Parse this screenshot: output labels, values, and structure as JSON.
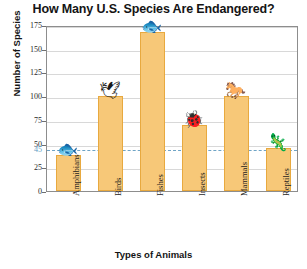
{
  "chart_data": {
    "type": "bar",
    "title": "How Many U.S. Species Are Endangered?",
    "xlabel": "Types of Animals",
    "ylabel": "Number of Species",
    "categories": [
      "Amphibians",
      "Birds",
      "Fishes",
      "Insects",
      "Mammals",
      "Reptiles"
    ],
    "values": [
      38,
      100,
      168,
      70,
      100,
      45
    ],
    "ylim": [
      0,
      175
    ],
    "ytick_labels": [
      "0",
      "25",
      "50",
      "75",
      "100",
      "125",
      "150",
      "175"
    ],
    "ytick_values": [
      0,
      25,
      50,
      75,
      100,
      125,
      150,
      175
    ],
    "grid": true,
    "legend": "none",
    "annotations": [
      {
        "name": "threshold-45",
        "label": "45",
        "value": 45,
        "style": "dashed-horizontal-line",
        "color": "#5e9ec4"
      }
    ],
    "icons": [
      {
        "name": "frog-icon",
        "category": "Amphibians",
        "glyph": "🐟"
      },
      {
        "name": "bird-icon",
        "category": "Birds",
        "glyph": "🕊"
      },
      {
        "name": "fish-icon",
        "category": "Fishes",
        "glyph": "🐟"
      },
      {
        "name": "beetle-icon",
        "category": "Insects",
        "glyph": "🐞"
      },
      {
        "name": "horse-icon",
        "category": "Mammals",
        "glyph": "🐎"
      },
      {
        "name": "lizard-icon",
        "category": "Reptiles",
        "glyph": "🦎"
      }
    ],
    "colors": {
      "bar_fill": "#f7c878",
      "bar_border": "#e8a93f",
      "threshold": "#6fa4c6",
      "grid": "#d8d8d8",
      "frame": "#8d8d8d",
      "background": "#ffffff"
    }
  }
}
